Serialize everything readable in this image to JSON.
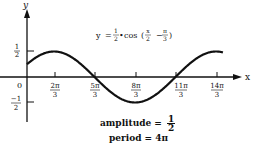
{
  "chart_data": {
    "type": "line",
    "equation": {
      "lhs": "y",
      "coef_num": "1",
      "coef_den": "2",
      "func": "cos",
      "arg_a_num": "x",
      "arg_a_den": "2",
      "arg_op": "−",
      "arg_b_num": "π",
      "arg_b_den": "3"
    },
    "xlabel": "x",
    "ylabel": "y",
    "x_ticks": [
      {
        "num": "2π",
        "den": "3",
        "value": 2.094
      },
      {
        "num": "5π",
        "den": "3",
        "value": 5.236
      },
      {
        "num": "8π",
        "den": "3",
        "value": 8.378
      },
      {
        "num": "11π",
        "den": "3",
        "value": 11.519
      },
      {
        "num": "14π",
        "den": "3",
        "value": 14.661
      }
    ],
    "origin_label": "0",
    "y_ticks": [
      {
        "num": "1",
        "den": "2",
        "value": 0.5
      },
      {
        "num": "−1",
        "den": "2",
        "value": -0.5
      }
    ],
    "xlim": [
      0,
      15.2
    ],
    "ylim": [
      -0.5,
      0.5
    ],
    "series": [
      {
        "name": "y = 1/2 cos(x/2 - π/3)",
        "x": [
          0,
          2.094,
          5.236,
          8.378,
          11.519,
          14.661
        ],
        "y": [
          0.25,
          0.5,
          0,
          -0.5,
          0,
          0.5
        ]
      }
    ],
    "annotations": {
      "amplitude_label": "amplitude =",
      "amplitude_num": "1",
      "amplitude_den": "2",
      "period_label": "period =",
      "period_value": "4π"
    },
    "grid": false
  }
}
